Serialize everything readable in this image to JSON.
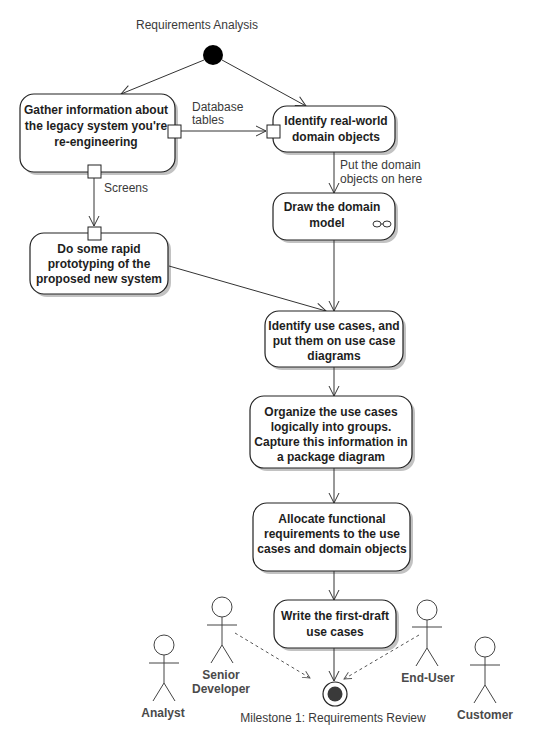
{
  "diagram": {
    "title": "Requirements Analysis",
    "type": "UML activity diagram",
    "nodes": [
      {
        "id": "gather",
        "lines": [
          "Gather information about",
          "the legacy system you're",
          "re-engineering"
        ]
      },
      {
        "id": "identify_domain",
        "lines": [
          "Identify real-world",
          "domain objects"
        ]
      },
      {
        "id": "draw_model",
        "lines": [
          "Draw the domain",
          "model"
        ],
        "icon": "rake-icon"
      },
      {
        "id": "prototype",
        "lines": [
          "Do some rapid",
          "prototyping of the",
          "proposed new system"
        ]
      },
      {
        "id": "identify_use_cases",
        "lines": [
          "Identify use cases, and",
          "put them on use case",
          "diagrams"
        ]
      },
      {
        "id": "organize",
        "lines": [
          "Organize the use cases",
          "logically into groups.",
          "Capture this information in",
          "a package diagram"
        ]
      },
      {
        "id": "allocate",
        "lines": [
          "Allocate functional",
          "requirements to the use",
          "cases and domain objects"
        ]
      },
      {
        "id": "write_draft",
        "lines": [
          "Write the first-draft",
          "use cases"
        ]
      }
    ],
    "edge_labels": {
      "database_tables": [
        "Database",
        "tables"
      ],
      "screens": "Screens",
      "put_domain": [
        "Put the domain",
        "objects on here"
      ]
    },
    "final_node_label": "Milestone 1: Requirements Review",
    "actors": [
      {
        "name_lines": [
          "Analyst"
        ]
      },
      {
        "name_lines": [
          "Senior",
          "Developer"
        ]
      },
      {
        "name_lines": [
          "End-User"
        ]
      },
      {
        "name_lines": [
          "Customer"
        ]
      }
    ]
  }
}
